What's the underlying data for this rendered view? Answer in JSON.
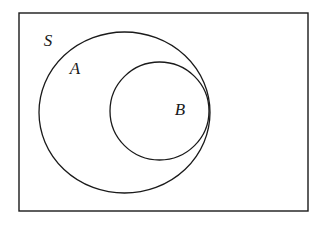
{
  "figure": {
    "type": "venn-diagram",
    "background_color": "#ffffff",
    "stroke_color": "#1a1a1a",
    "text_color": "#1a1a1a"
  },
  "canvas": {
    "width": 321,
    "height": 226
  },
  "regions": [
    {
      "id": "universe",
      "name": "S",
      "shape": "rectangle",
      "label": "S",
      "label_x": 48,
      "label_y": 42,
      "x": 19,
      "y": 13,
      "width": 289,
      "height": 198,
      "stroke_width": 1.4
    },
    {
      "id": "set-a",
      "name": "A",
      "shape": "ellipse",
      "label": "A",
      "label_x": 75,
      "label_y": 70,
      "cx": 124.5,
      "cy": 112.5,
      "rx": 85.5,
      "ry": 80.5,
      "stroke_width": 1.3
    },
    {
      "id": "set-b",
      "name": "B",
      "shape": "ellipse",
      "label": "B",
      "label_x": 180,
      "label_y": 111,
      "cx": 159.5,
      "cy": 111,
      "rx": 49.5,
      "ry": 49,
      "stroke_width": 1.3
    }
  ],
  "labels": {
    "universe_label": "S",
    "set_a_label": "A",
    "set_b_label": "B"
  }
}
